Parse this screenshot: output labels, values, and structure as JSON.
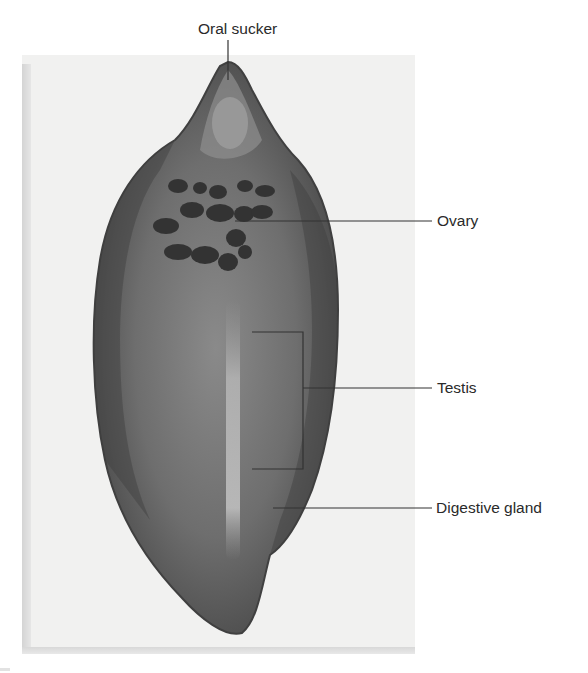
{
  "figure": {
    "labels": [
      {
        "id": "oral-sucker",
        "text": "Oral sucker"
      },
      {
        "id": "ovary",
        "text": "Ovary"
      },
      {
        "id": "testis",
        "text": "Testis"
      },
      {
        "id": "digestive-gland",
        "text": "Digestive gland"
      }
    ]
  },
  "colors": {
    "page_background": "#ffffff",
    "photo_background": "#f1f1f0",
    "specimen_body": "#5a5a5a",
    "specimen_dark": "#3c3c3c",
    "leader_line": "#333333",
    "label_text": "#2a2a2a"
  }
}
